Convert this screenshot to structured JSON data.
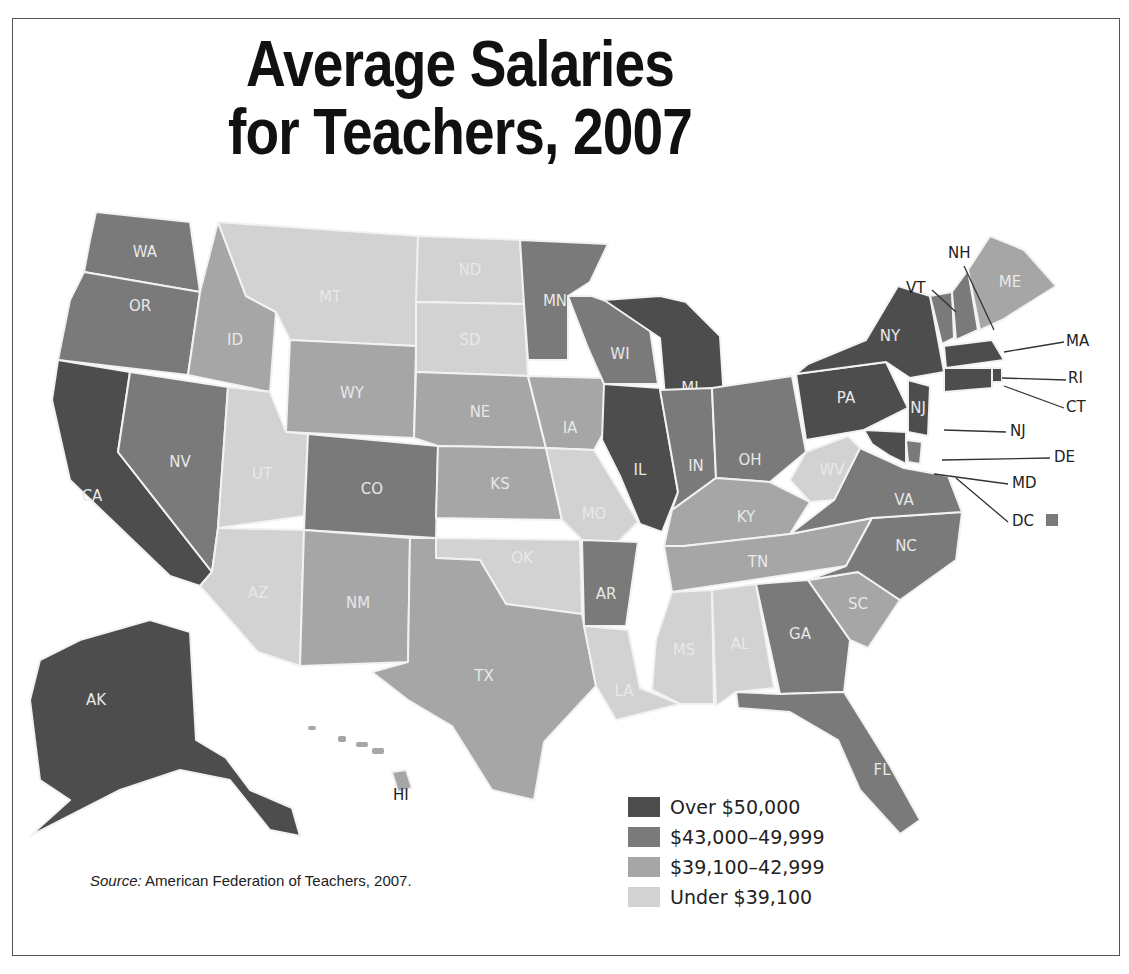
{
  "title_line1": "Average Salaries",
  "title_line2": "for Teachers, 2007",
  "source_prefix": "Source:",
  "source_text": " American Federation of Teachers, 2007.",
  "colors": {
    "tier1": "#4d4d4d",
    "tier2": "#7a7a7a",
    "tier3": "#a6a6a6",
    "tier4": "#d2d2d2"
  },
  "legend": [
    {
      "label": "Over $50,000",
      "tier": "tier1"
    },
    {
      "label": "$43,000–49,999",
      "tier": "tier2"
    },
    {
      "label": "$39,100–42,999",
      "tier": "tier3"
    },
    {
      "label": "Under $39,100",
      "tier": "tier4"
    }
  ],
  "states": [
    {
      "abbr": "WA",
      "tier": "tier2",
      "pts": "96,212 190,222 200,292 84,272 90,240",
      "lx": 145,
      "ly": 252
    },
    {
      "abbr": "OR",
      "tier": "tier2",
      "pts": "84,272 200,292 188,375 58,360 70,300",
      "lx": 140,
      "ly": 306
    },
    {
      "abbr": "CA",
      "tier": "tier1",
      "pts": "58,360 130,372 118,452 212,572 200,586 170,576 70,480 52,400",
      "lx": 92,
      "ly": 496
    },
    {
      "abbr": "NV",
      "tier": "tier2",
      "pts": "130,372 228,387 218,528 212,572 118,452",
      "lx": 180,
      "ly": 462
    },
    {
      "abbr": "ID",
      "tier": "tier3",
      "pts": "200,292 218,222 246,296 276,312 270,392 188,375",
      "lx": 235,
      "ly": 340
    },
    {
      "abbr": "MT",
      "tier": "tier4",
      "pts": "218,222 418,236 416,346 290,340 276,312 246,296",
      "lx": 330,
      "ly": 297
    },
    {
      "abbr": "WY",
      "tier": "tier3",
      "pts": "290,340 416,346 414,438 286,432",
      "lx": 352,
      "ly": 393
    },
    {
      "abbr": "UT",
      "tier": "tier4",
      "pts": "228,387 270,392 286,432 308,434 304,516 218,528",
      "lx": 262,
      "ly": 474
    },
    {
      "abbr": "CO",
      "tier": "tier2",
      "pts": "308,434 438,446 436,538 304,530",
      "lx": 372,
      "ly": 489
    },
    {
      "abbr": "AZ",
      "tier": "tier4",
      "pts": "218,528 304,530 300,666 258,652 200,586 212,572",
      "lx": 258,
      "ly": 593
    },
    {
      "abbr": "NM",
      "tier": "tier3",
      "pts": "304,530 410,538 408,662 300,666",
      "lx": 358,
      "ly": 603
    },
    {
      "abbr": "ND",
      "tier": "tier4",
      "pts": "418,236 520,240 524,304 416,302",
      "lx": 470,
      "ly": 270
    },
    {
      "abbr": "SD",
      "tier": "tier4",
      "pts": "416,302 524,304 528,376 416,372",
      "lx": 470,
      "ly": 340
    },
    {
      "abbr": "NE",
      "tier": "tier3",
      "pts": "416,372 528,376 546,448 438,446 414,438",
      "lx": 480,
      "ly": 412
    },
    {
      "abbr": "KS",
      "tier": "tier3",
      "pts": "438,446 546,448 562,520 436,518",
      "lx": 500,
      "ly": 484
    },
    {
      "abbr": "OK",
      "tier": "tier4",
      "pts": "436,538 580,540 582,614 506,604 480,560 436,558",
      "lx": 522,
      "ly": 558
    },
    {
      "abbr": "TX",
      "tier": "tier3",
      "pts": "436,558 480,560 506,604 582,614 596,686 544,742 534,800 492,790 452,726 408,700 372,672 408,662 410,538 436,538",
      "lx": 484,
      "ly": 676
    },
    {
      "abbr": "MN",
      "tier": "tier2",
      "pts": "520,240 608,244 590,282 568,296 568,360 528,360 524,304",
      "lx": 555,
      "ly": 301
    },
    {
      "abbr": "IA",
      "tier": "tier3",
      "pts": "528,376 604,378 614,414 594,450 546,448",
      "lx": 570,
      "ly": 428
    },
    {
      "abbr": "MO",
      "tier": "tier4",
      "pts": "546,448 594,450 638,522 612,548 582,540 562,520",
      "lx": 594,
      "ly": 514
    },
    {
      "abbr": "AR",
      "tier": "tier2",
      "pts": "582,540 638,542 626,626 584,626",
      "lx": 606,
      "ly": 594
    },
    {
      "abbr": "LA",
      "tier": "tier4",
      "pts": "584,626 628,630 640,688 680,704 616,720 596,686",
      "lx": 624,
      "ly": 691
    },
    {
      "abbr": "WI",
      "tier": "tier2",
      "pts": "568,296 592,296 648,316 658,384 604,384 588,348",
      "lx": 620,
      "ly": 354
    },
    {
      "abbr": "IL",
      "tier": "tier1",
      "pts": "604,384 660,388 678,492 662,532 640,524 620,476 602,440",
      "lx": 640,
      "ly": 470
    },
    {
      "abbr": "MI",
      "tier": "tier1",
      "pts": "604,300 660,296 686,302 720,336 724,400 666,408 660,338",
      "lx": 690,
      "ly": 388
    },
    {
      "abbr": "IN",
      "tier": "tier2",
      "pts": "660,390 712,388 716,478 672,510 678,492",
      "lx": 696,
      "ly": 466
    },
    {
      "abbr": "OH",
      "tier": "tier2",
      "pts": "712,388 792,376 806,452 770,482 716,478",
      "lx": 750,
      "ly": 460
    },
    {
      "abbr": "KY",
      "tier": "tier3",
      "pts": "672,510 716,478 770,482 810,502 790,534 684,546 664,546",
      "lx": 746,
      "ly": 517
    },
    {
      "abbr": "TN",
      "tier": "tier3",
      "pts": "664,546 684,546 790,534 872,518 846,566 672,592",
      "lx": 758,
      "ly": 562
    },
    {
      "abbr": "MS",
      "tier": "tier4",
      "pts": "672,592 712,590 714,704 680,704 652,690 656,640",
      "lx": 684,
      "ly": 650
    },
    {
      "abbr": "AL",
      "tier": "tier4",
      "pts": "712,590 756,584 774,688 736,692 716,706",
      "lx": 740,
      "ly": 644
    },
    {
      "abbr": "GA",
      "tier": "tier2",
      "pts": "756,584 808,580 850,640 844,692 780,694",
      "lx": 800,
      "ly": 634
    },
    {
      "abbr": "FL",
      "tier": "tier2",
      "pts": "736,692 780,694 844,692 890,766 920,820 900,834 860,790 838,740 790,712 738,708",
      "lx": 882,
      "ly": 770
    },
    {
      "abbr": "SC",
      "tier": "tier3",
      "pts": "808,580 858,572 900,600 868,648 850,640",
      "lx": 858,
      "ly": 604
    },
    {
      "abbr": "NC",
      "tier": "tier2",
      "pts": "846,566 872,518 962,512 956,560 900,600 858,572 808,580",
      "lx": 906,
      "ly": 546
    },
    {
      "abbr": "VA",
      "tier": "tier2",
      "pts": "790,534 834,500 860,448 904,468 948,476 962,512 872,518",
      "lx": 904,
      "ly": 500
    },
    {
      "abbr": "WV",
      "tier": "tier4",
      "pts": "806,452 848,436 860,448 834,500 810,502 790,480",
      "lx": 832,
      "ly": 470
    },
    {
      "abbr": "PA",
      "tier": "tier1",
      "pts": "796,374 886,362 908,408 864,430 806,440",
      "lx": 846,
      "ly": 398
    },
    {
      "abbr": "NY",
      "tier": "tier1",
      "pts": "808,364 866,340 898,286 930,296 944,372 910,378 886,362 796,374",
      "lx": 890,
      "ly": 336
    },
    {
      "abbr": "NJ",
      "tier": "tier1",
      "pts": "908,380 930,386 928,436 908,432",
      "lx": 918,
      "ly": 408
    },
    {
      "abbr": "DE",
      "tier": "tier2",
      "pts": "906,440 922,442 920,464 908,462",
      "lx": 0,
      "ly": 0
    },
    {
      "abbr": "MD",
      "tier": "tier1",
      "pts": "864,430 906,432 906,464 890,456 872,444",
      "lx": 0,
      "ly": 0
    },
    {
      "abbr": "VT",
      "tier": "tier2",
      "pts": "930,296 952,292 954,338 942,344",
      "lx": 0,
      "ly": 0
    },
    {
      "abbr": "NH",
      "tier": "tier2",
      "pts": "952,292 968,270 978,330 956,340",
      "lx": 0,
      "ly": 0
    },
    {
      "abbr": "ME",
      "tier": "tier3",
      "pts": "968,270 990,236 1024,250 1056,286 1002,320 980,330",
      "lx": 1010,
      "ly": 282
    },
    {
      "abbr": "MA",
      "tier": "tier1",
      "pts": "944,346 992,340 1004,360 946,368",
      "lx": 0,
      "ly": 0
    },
    {
      "abbr": "RI",
      "tier": "tier1",
      "pts": "992,368 1002,368 1002,382 992,382",
      "lx": 0,
      "ly": 0
    },
    {
      "abbr": "CT",
      "tier": "tier1",
      "pts": "944,368 992,368 992,388 944,392",
      "lx": 0,
      "ly": 0
    },
    {
      "abbr": "AK",
      "tier": "tier1",
      "pts": "40,660 80,640 150,620 190,632 196,740 226,758 250,790 292,808 300,836 270,830 230,780 180,770 120,790 30,836 70,800 40,780 30,700",
      "lx": 96,
      "ly": 700
    },
    {
      "abbr": "HI",
      "tier": "tier3",
      "pts": "392,772 406,770 412,788 398,792",
      "lx": 0,
      "ly": 0
    }
  ],
  "external_labels": [
    {
      "text": "NH",
      "x": 948,
      "y": 258,
      "line": "964,266 994,330"
    },
    {
      "text": "VT",
      "x": 906,
      "y": 293,
      "line": "932,290 956,312"
    },
    {
      "text": "MA",
      "x": 1066,
      "y": 346,
      "line": "1064,342 1004,352"
    },
    {
      "text": "RI",
      "x": 1068,
      "y": 383,
      "line": "1066,380 1002,378"
    },
    {
      "text": "CT",
      "x": 1066,
      "y": 412,
      "line": "1064,408 1004,386"
    },
    {
      "text": "NJ",
      "x": 1010,
      "y": 436,
      "line": "1006,432 944,430"
    },
    {
      "text": "DE",
      "x": 1054,
      "y": 462,
      "line": "1050,458 942,460"
    },
    {
      "text": "MD",
      "x": 1012,
      "y": 488,
      "line": "1008,484 934,474"
    },
    {
      "text": "DC",
      "x": 1012,
      "y": 526,
      "line": "1008,522 956,478"
    },
    {
      "text": "HI",
      "x": 393,
      "y": 800,
      "line": ""
    }
  ],
  "dc_marker": {
    "tier": "tier2"
  },
  "hi_islands": [
    {
      "x": 308,
      "y": 726,
      "w": 8,
      "h": 4
    },
    {
      "x": 338,
      "y": 736,
      "w": 8,
      "h": 6
    },
    {
      "x": 356,
      "y": 742,
      "w": 12,
      "h": 5
    },
    {
      "x": 372,
      "y": 748,
      "w": 12,
      "h": 6
    }
  ]
}
